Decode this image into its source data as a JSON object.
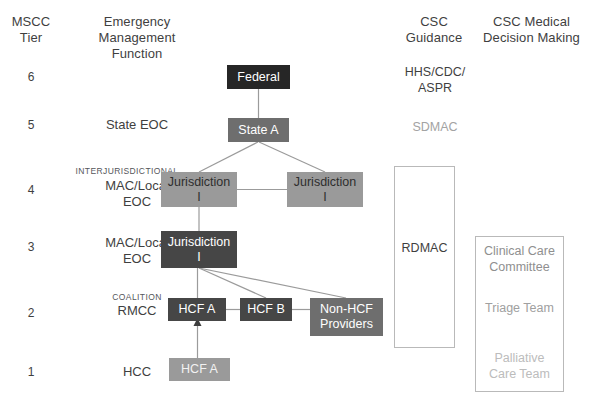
{
  "headers": {
    "mscc_tier": "MSCC\nTier",
    "emergency_function": "Emergency\nManagement\nFunction",
    "csc_guidance": "CSC\nGuidance",
    "csc_medical": "CSC Medical\nDecision Making"
  },
  "header_lines": {
    "mscc_tier_1": "MSCC",
    "mscc_tier_2": "Tier",
    "emf_1": "Emergency",
    "emf_2": "Management",
    "emf_3": "Function",
    "csc_guidance_1": "CSC",
    "csc_guidance_2": "Guidance",
    "csc_medical_1": "CSC Medical",
    "csc_medical_2": "Decision Making"
  },
  "tiers": [
    {
      "number": "6",
      "function": "",
      "sub": ""
    },
    {
      "number": "5",
      "function": "State EOC",
      "sub": ""
    },
    {
      "number": "4",
      "function": "MAC/Local\nEOC",
      "sub": "INTERJURISDICTIONAL"
    },
    {
      "number": "3",
      "function": "MAC/Local\nEOC",
      "sub": ""
    },
    {
      "number": "2",
      "function": "RMCC",
      "sub": "COALITION"
    },
    {
      "number": "1",
      "function": "HCC",
      "sub": ""
    }
  ],
  "tier_labels": {
    "t6_num": "6",
    "t5_num": "5",
    "t5_fn": "State EOC",
    "t4_num": "4",
    "t4_sub": "INTERJURISDICTIONAL",
    "t4_fn_1": "MAC/Local",
    "t4_fn_2": "EOC",
    "t3_num": "3",
    "t3_fn_1": "MAC/Local",
    "t3_fn_2": "EOC",
    "t2_num": "2",
    "t2_sub": "COALITION",
    "t2_fn": "RMCC",
    "t1_num": "1",
    "t1_fn": "HCC"
  },
  "nodes": {
    "federal": "Federal",
    "state_a": "State A",
    "jurisdiction_4_left_1": "Jurisdiction",
    "jurisdiction_4_left_2": "I",
    "jurisdiction_4_right_1": "Jurisdiction",
    "jurisdiction_4_right_2": "I",
    "jurisdiction_3_1": "Jurisdiction",
    "jurisdiction_3_2": "I",
    "hcf_a_tier2": "HCF A",
    "hcf_b_tier2": "HCF B",
    "non_hcf_providers_1": "Non-HCF",
    "non_hcf_providers_2": "Providers",
    "hcf_a_tier1": "HCF A"
  },
  "csc_guidance": {
    "hhs_line1": "HHS/CDC/",
    "hhs_line2": "ASPR",
    "sdmac": "SDMAC",
    "rdmac": "RDMAC"
  },
  "csc_medical": {
    "clinical_care_1": "Clinical Care",
    "clinical_care_2": "Committee",
    "triage_team": "Triage Team",
    "palliative_1": "Palliative",
    "palliative_2": "Care Team"
  },
  "colors": {
    "node_black": "#262626",
    "node_dark": "#464646",
    "node_mid": "#6e6e6e",
    "node_light": "#9a9a9a",
    "line": "#9b9b9b",
    "outline": "#b9b9b9",
    "text": "#3f3f3f",
    "muted_text": "#9b9b9b"
  }
}
